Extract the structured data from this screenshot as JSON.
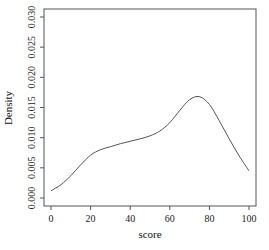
{
  "chart_data": {
    "type": "line",
    "title": "",
    "xlabel": "score",
    "ylabel": "Density",
    "xlim": [
      0,
      100
    ],
    "ylim": [
      0,
      0.03
    ],
    "x_ticks": [
      0,
      20,
      40,
      60,
      80,
      100
    ],
    "x_tick_labels": [
      "0",
      "20",
      "40",
      "60",
      "80",
      "100"
    ],
    "y_ticks": [
      0.0,
      0.005,
      0.01,
      0.015,
      0.02,
      0.025,
      0.03
    ],
    "y_tick_labels": [
      "0.000",
      "0.005",
      "0.010",
      "0.015",
      "0.020",
      "0.025",
      "0.030"
    ],
    "grid": false,
    "legend": null,
    "series": [
      {
        "name": "density",
        "color": "#555555",
        "x": [
          0,
          5,
          10,
          15,
          20,
          25,
          30,
          35,
          40,
          45,
          50,
          55,
          60,
          65,
          70,
          75,
          80,
          85,
          90,
          95,
          100
        ],
        "y": [
          0.0012,
          0.0022,
          0.0037,
          0.0055,
          0.0071,
          0.008,
          0.0085,
          0.009,
          0.0094,
          0.0098,
          0.0103,
          0.0111,
          0.0125,
          0.0145,
          0.0163,
          0.0168,
          0.0155,
          0.0128,
          0.0098,
          0.007,
          0.0045
        ]
      }
    ]
  }
}
